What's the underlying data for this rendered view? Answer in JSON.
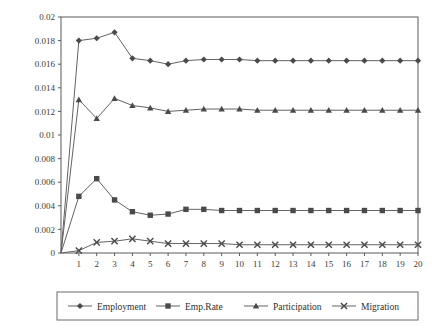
{
  "chart_data": {
    "type": "line",
    "title": "",
    "subtitle": "",
    "xlabel": "",
    "ylabel": "",
    "xlim": [
      0,
      20
    ],
    "ylim": [
      0,
      0.02
    ],
    "grid": false,
    "legend_position": "bottom",
    "x": [
      0,
      1,
      2,
      3,
      4,
      5,
      6,
      7,
      8,
      9,
      10,
      11,
      12,
      13,
      14,
      15,
      16,
      17,
      18,
      19,
      20
    ],
    "x_tick_labels": [
      "1",
      "2",
      "3",
      "4",
      "5",
      "6",
      "7",
      "8",
      "9",
      "10",
      "11",
      "12",
      "13",
      "14",
      "15",
      "16",
      "17",
      "18",
      "19",
      "20"
    ],
    "y_tick_labels": [
      "0.02",
      "0.018",
      "0.016",
      "0.014",
      "0.012",
      "0.01",
      "0.008",
      "0.006",
      "0.004",
      "0.002",
      "0"
    ],
    "y_ticks": [
      0.02,
      0.018,
      0.016,
      0.014,
      0.012,
      0.01,
      0.008,
      0.006,
      0.004,
      0.002,
      0
    ],
    "series": [
      {
        "name": "Employment",
        "marker": "diamond",
        "color": "#4a4a4a",
        "values": [
          0,
          0.018,
          0.0182,
          0.0187,
          0.0165,
          0.0163,
          0.016,
          0.0163,
          0.0164,
          0.0164,
          0.0164,
          0.0163,
          0.0163,
          0.0163,
          0.0163,
          0.0163,
          0.0163,
          0.0163,
          0.0163,
          0.0163,
          0.0163
        ]
      },
      {
        "name": "Emp.Rate",
        "marker": "square",
        "color": "#6f6f6f",
        "values": [
          0,
          0.0048,
          0.0063,
          0.0045,
          0.0035,
          0.0032,
          0.0033,
          0.0037,
          0.0037,
          0.0036,
          0.0036,
          0.0036,
          0.0036,
          0.0036,
          0.0036,
          0.0036,
          0.0036,
          0.0036,
          0.0036,
          0.0036,
          0.0036
        ]
      },
      {
        "name": "Participation",
        "marker": "triangle",
        "color": "#4a4a4a",
        "values": [
          0,
          0.013,
          0.0114,
          0.0131,
          0.0125,
          0.0123,
          0.012,
          0.0121,
          0.0122,
          0.0122,
          0.0122,
          0.0121,
          0.0121,
          0.0121,
          0.0121,
          0.0121,
          0.0121,
          0.0121,
          0.0121,
          0.0121,
          0.0121
        ]
      },
      {
        "name": "Migration",
        "marker": "cross",
        "color": "#4a4a4a",
        "values": [
          0,
          0.0002,
          0.0009,
          0.001,
          0.0012,
          0.001,
          0.0008,
          0.0008,
          0.0008,
          0.0008,
          0.0007,
          0.0007,
          0.0007,
          0.0007,
          0.0007,
          0.0007,
          0.0007,
          0.0007,
          0.0007,
          0.0007,
          0.0007
        ]
      }
    ]
  },
  "legend": {
    "items": [
      {
        "label": "Employment",
        "marker": "diamond"
      },
      {
        "label": "Emp.Rate",
        "marker": "square"
      },
      {
        "label": "Participation",
        "marker": "triangle"
      },
      {
        "label": "Migration",
        "marker": "cross"
      }
    ]
  }
}
